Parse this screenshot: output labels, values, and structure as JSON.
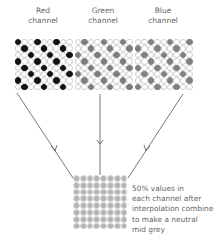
{
  "channels": [
    {
      "id": "red",
      "label_line1": "Red",
      "label_line2": "channel",
      "dot_color": "#111111",
      "offset": 0,
      "x": 15,
      "y": 39
    },
    {
      "id": "green",
      "label_line1": "Green",
      "label_line2": "channel",
      "dot_color": "#7d7d7d",
      "offset": 1,
      "x": 75,
      "y": 39
    },
    {
      "id": "blue",
      "label_line1": "Blue",
      "label_line2": "channel",
      "dot_color": "#808080",
      "offset": 2,
      "x": 135,
      "y": 39
    }
  ],
  "grid": {
    "cols": 9,
    "rows": 8
  },
  "result": {
    "dot_color": "#b4b4b4",
    "cols": 8,
    "rows": 8,
    "note_lines": [
      "50% values in",
      "each channel after",
      "interpolation combine",
      "to make a neutral",
      "mid grey"
    ]
  }
}
